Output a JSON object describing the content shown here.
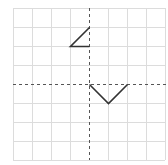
{
  "grid": {
    "columns": 8,
    "rows": 8,
    "cell_size": 19,
    "origin_px": [
      13,
      8
    ],
    "line_color": "#dcdcdc",
    "axis_color": "#555555"
  },
  "axes": {
    "x_axis_row": 4,
    "y_axis_col": 4,
    "style": "dashed"
  },
  "shapes": [
    {
      "name": "shape-upper-left",
      "points": [
        [
          0,
          3
        ],
        [
          -1,
          2
        ],
        [
          0,
          2
        ]
      ],
      "stroke": "#333333"
    },
    {
      "name": "shape-v-lower-right",
      "points": [
        [
          0,
          0
        ],
        [
          1,
          -1
        ],
        [
          2,
          0
        ]
      ],
      "stroke": "#333333"
    }
  ]
}
